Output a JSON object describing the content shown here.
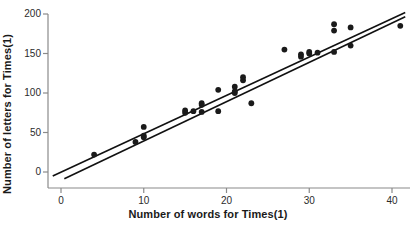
{
  "chart_data": {
    "type": "scatter",
    "title": "",
    "xlabel": "Number of words for Times(1)",
    "ylabel": "Number of letters for Times(1)",
    "xlim": [
      -1.5,
      42.5
    ],
    "ylim": [
      -12,
      210
    ],
    "xticks": [
      0,
      10,
      20,
      30,
      40
    ],
    "yticks": [
      0,
      50,
      100,
      150,
      200
    ],
    "grid": false,
    "legend": false,
    "marker": "filled-circle",
    "marker_color": "#1a1a1a",
    "axis_color": "#808080",
    "line_color": "#111111",
    "points": [
      {
        "x": 4,
        "y": 22
      },
      {
        "x": 9,
        "y": 38
      },
      {
        "x": 10,
        "y": 44
      },
      {
        "x": 10,
        "y": 46
      },
      {
        "x": 10,
        "y": 57
      },
      {
        "x": 15,
        "y": 75
      },
      {
        "x": 15,
        "y": 78
      },
      {
        "x": 16,
        "y": 77
      },
      {
        "x": 17,
        "y": 76
      },
      {
        "x": 17,
        "y": 85
      },
      {
        "x": 17,
        "y": 87
      },
      {
        "x": 19,
        "y": 77
      },
      {
        "x": 19,
        "y": 104
      },
      {
        "x": 21,
        "y": 100
      },
      {
        "x": 21,
        "y": 102
      },
      {
        "x": 21,
        "y": 108
      },
      {
        "x": 22,
        "y": 116
      },
      {
        "x": 22,
        "y": 120
      },
      {
        "x": 23,
        "y": 87
      },
      {
        "x": 27,
        "y": 155
      },
      {
        "x": 29,
        "y": 146
      },
      {
        "x": 29,
        "y": 149
      },
      {
        "x": 30,
        "y": 150
      },
      {
        "x": 30,
        "y": 152
      },
      {
        "x": 31,
        "y": 151
      },
      {
        "x": 33,
        "y": 152
      },
      {
        "x": 33,
        "y": 179
      },
      {
        "x": 33,
        "y": 187
      },
      {
        "x": 35,
        "y": 160
      },
      {
        "x": 35,
        "y": 183
      },
      {
        "x": 41,
        "y": 185
      }
    ],
    "lines": [
      {
        "name": "fit-line-upper",
        "x1": -1.0,
        "y1": -5.0,
        "x2": 41.6,
        "y2": 202.0
      },
      {
        "name": "fit-line-lower",
        "x1": 0.4,
        "y1": -8.5,
        "x2": 41.6,
        "y2": 196.5
      }
    ]
  }
}
